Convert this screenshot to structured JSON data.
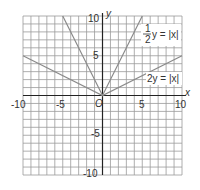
{
  "chart_data": {
    "type": "line",
    "title": "",
    "xlabel": "x",
    "ylabel": "y",
    "xlim": [
      -10,
      10
    ],
    "ylim": [
      -10,
      10
    ],
    "grid": true,
    "grid_step": 1,
    "tick_labels": {
      "x": [
        "-10",
        "-5",
        "5",
        "10"
      ],
      "y": [
        "10",
        "5",
        "-5",
        "-10"
      ],
      "origin": "O"
    },
    "series": [
      {
        "name": "(1/2)y = |x|",
        "equation": "y = 2|x|",
        "x": [
          -5,
          0,
          5
        ],
        "y": [
          10,
          0,
          10
        ]
      },
      {
        "name": "2y = |x|",
        "equation": "y = |x|/2",
        "x": [
          -10,
          0,
          10
        ],
        "y": [
          5,
          0,
          5
        ]
      }
    ],
    "annotations": [
      {
        "text_frac_num": "1",
        "text_frac_den": "2",
        "text": "y = |x|",
        "near": [
          7,
          8
        ]
      },
      {
        "text": "2y = |x|",
        "near": [
          7.5,
          2.5
        ]
      }
    ]
  },
  "labels": {
    "x_axis": "x",
    "y_axis": "y",
    "origin": "O",
    "x_neg10": "-10",
    "x_neg5": "-5",
    "x_5": "5",
    "x_10": "10",
    "y_10": "10",
    "y_5": "5",
    "y_neg5": "-5",
    "y_neg10": "-10",
    "eq1_num": "1",
    "eq1_den": "2",
    "eq1_rest": "y = |x|",
    "eq2": "2y = |x|"
  },
  "colors": {
    "grid": "#9a9a9a",
    "axis": "#222222",
    "curve": "#8a8a8a",
    "text": "#333333"
  }
}
